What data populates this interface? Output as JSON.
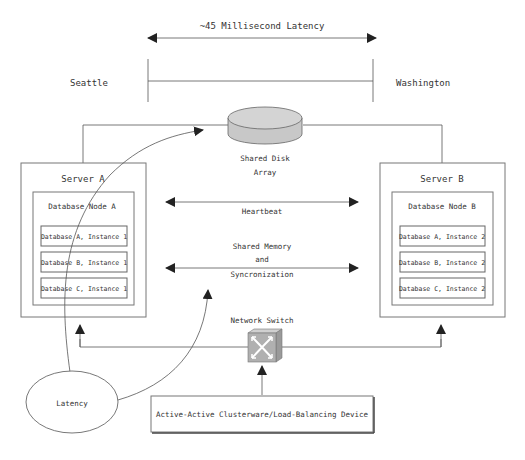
{
  "diagram": {
    "latency_span_label": "~45 Millisecond Latency",
    "sites": {
      "left": "Seattle",
      "right": "Washington"
    },
    "shared_disk": {
      "label_line1": "Shared Disk",
      "label_line2": "Array"
    },
    "server_a": {
      "title": "Server A",
      "node": "Database Node A",
      "instances": [
        "Database A, Instance 1",
        "Database B, Instance 1",
        "Database C, Instance 1"
      ]
    },
    "server_b": {
      "title": "Server B",
      "node": "Database Node B",
      "instances": [
        "Database A, Instance 2",
        "Database B, Instance 2",
        "Database C, Instance 2"
      ]
    },
    "heartbeat": "Heartbeat",
    "shared_memory": {
      "line1": "Shared Memory",
      "line2": "and",
      "line3": "Syncronization"
    },
    "network_switch": "Network Switch",
    "latency_bubble": "Latency",
    "load_balancer": "Active-Active Clusterware/Load-Balancing Device",
    "colors": {
      "disk_fill": "#c8c8c8",
      "switch_fill": "#b0b0b0",
      "line": "#555555"
    }
  }
}
